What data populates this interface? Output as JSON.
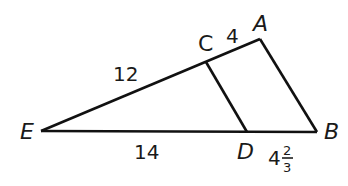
{
  "figure": {
    "type": "similar triangles",
    "stroke_color": "#111111",
    "vertices": {
      "E": {
        "label": "E",
        "x": 41,
        "y": 131
      },
      "A": {
        "label": "A",
        "x": 260,
        "y": 39
      },
      "B": {
        "label": "B",
        "x": 317,
        "y": 132
      },
      "C": {
        "label": "C",
        "x": 206,
        "y": 62
      },
      "D": {
        "label": "D",
        "x": 247,
        "y": 132
      }
    },
    "segments": {
      "EC": "12",
      "CA": "4",
      "ED": "14",
      "DB_whole": "4",
      "DB_num": "2",
      "DB_den": "3"
    }
  }
}
